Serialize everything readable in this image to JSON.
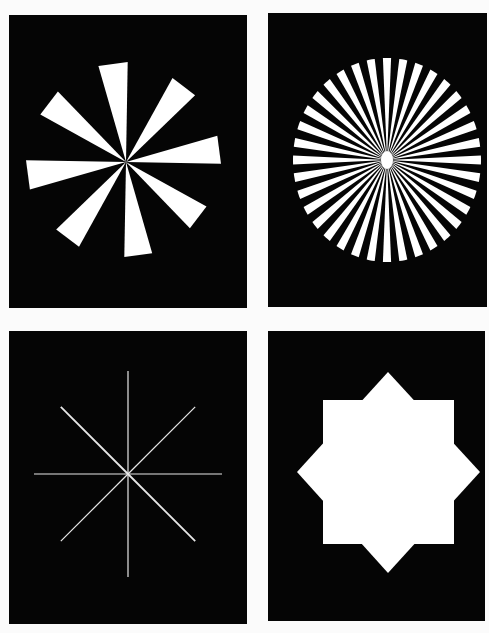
{
  "figure": {
    "background_color": "#fbfbfb",
    "panel_color": "#050505",
    "shape_color": "#ffffff",
    "panels": [
      {
        "id": "pinwheel",
        "label": "8-wedge pinwheel",
        "wedge_count": 8,
        "pattern": "white triangular wedges radiating from center, rotated pinwheel arrangement"
      },
      {
        "id": "siemens-star",
        "label": "Siemens star",
        "spoke_count": 36,
        "pattern": "alternating black and white radial spokes within a circle"
      },
      {
        "id": "line-star",
        "label": "8-ray line star",
        "ray_count": 8,
        "pattern": "thin white lines radiating from center at 45 degree intervals"
      },
      {
        "id": "octagram",
        "label": "8-pointed star",
        "point_count": 8,
        "pattern": "solid white star formed by two overlapping squares, one rotated 45 degrees"
      }
    ]
  }
}
